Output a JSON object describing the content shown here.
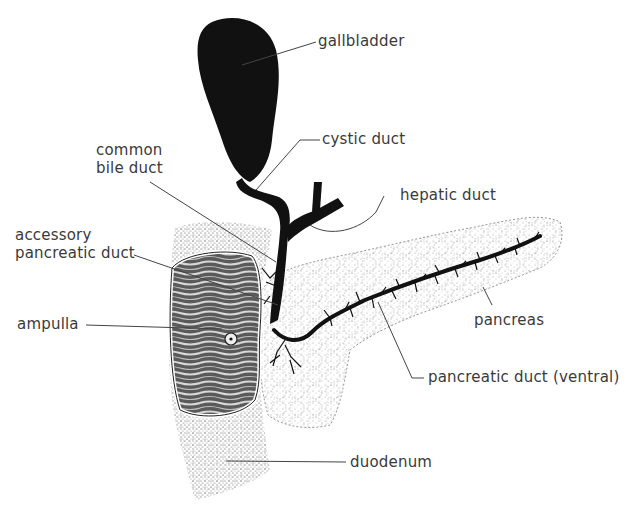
{
  "figure": {
    "type": "anatomical-diagram",
    "colors": {
      "ink": "#111111",
      "label_text": "#3a3a3a",
      "leader_line": "#444444",
      "stipple": "#777777",
      "background": "#ffffff"
    }
  },
  "labels": {
    "gallbladder": "gallbladder",
    "cystic_duct": "cystic duct",
    "common_bile_duct_line1": "common",
    "common_bile_duct_line2": "bile duct",
    "hepatic_duct": "hepatic duct",
    "accessory_pancreatic_duct_line1": "accessory",
    "accessory_pancreatic_duct_line2": "pancreatic duct",
    "ampulla": "ampulla",
    "pancreas": "pancreas",
    "pancreatic_duct_ventral": "pancreatic duct (ventral)",
    "duodenum": "duodenum"
  }
}
